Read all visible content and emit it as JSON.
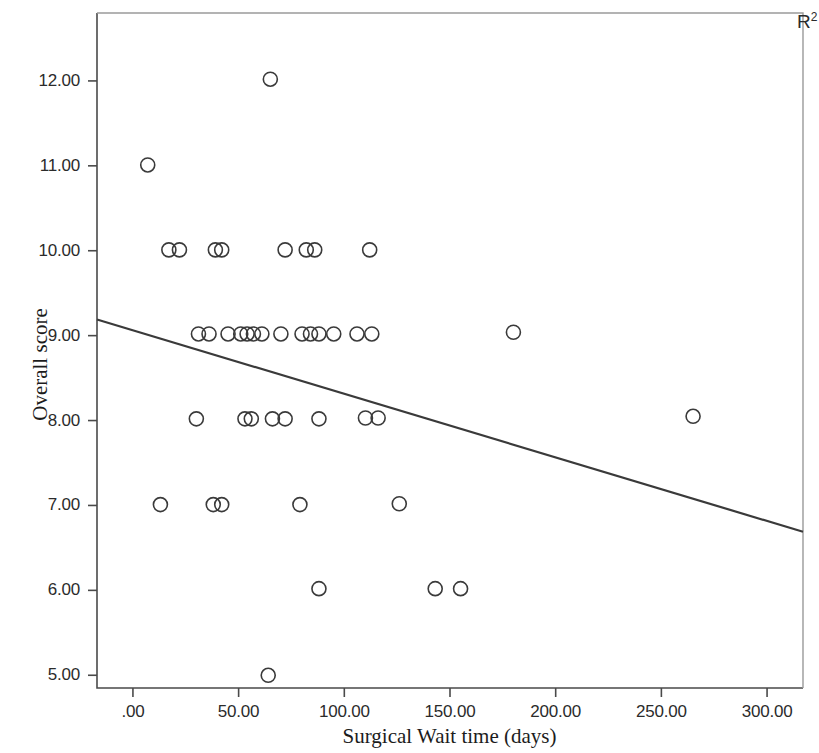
{
  "chart_data": {
    "type": "scatter",
    "title": "",
    "xlabel": "Surgical Wait time (days)",
    "ylabel": "Overall score",
    "xlim": [
      -17,
      317
    ],
    "ylim": [
      4.85,
      12.8
    ],
    "grid": false,
    "legend": null,
    "annotations": [
      {
        "name": "r-squared",
        "text": "R",
        "superscript": "2",
        "position": "top-right"
      }
    ],
    "x_ticks": [
      {
        "value": 0,
        "label": ".00"
      },
      {
        "value": 50,
        "label": "50.00"
      },
      {
        "value": 100,
        "label": "100.00"
      },
      {
        "value": 150,
        "label": "150.00"
      },
      {
        "value": 200,
        "label": "200.00"
      },
      {
        "value": 250,
        "label": "250.00"
      },
      {
        "value": 300,
        "label": "300.00"
      }
    ],
    "y_ticks": [
      {
        "value": 5,
        "label": "5.00"
      },
      {
        "value": 6,
        "label": "6.00"
      },
      {
        "value": 7,
        "label": "7.00"
      },
      {
        "value": 8,
        "label": "8.00"
      },
      {
        "value": 9,
        "label": "9.00"
      },
      {
        "value": 10,
        "label": "10.00"
      },
      {
        "value": 11,
        "label": "11.00"
      },
      {
        "value": 12,
        "label": "12.00"
      }
    ],
    "marker": {
      "shape": "circle",
      "filled": false,
      "radius": 7,
      "stroke": "#3a3a3a",
      "stroke_width": 1.6
    },
    "fit_line": {
      "name": "linear-regression-line",
      "color": "#3a3a3a",
      "width": 2.2,
      "x_start": -17,
      "y_start": 9.19,
      "x_end": 317,
      "y_end": 6.69
    },
    "points": [
      {
        "x": 65,
        "y": 12.02
      },
      {
        "x": 7,
        "y": 11.01
      },
      {
        "x": 17,
        "y": 10.01
      },
      {
        "x": 22,
        "y": 10.01
      },
      {
        "x": 39,
        "y": 10.01
      },
      {
        "x": 42,
        "y": 10.01
      },
      {
        "x": 72,
        "y": 10.01
      },
      {
        "x": 82,
        "y": 10.01
      },
      {
        "x": 86,
        "y": 10.01
      },
      {
        "x": 112,
        "y": 10.01
      },
      {
        "x": 31,
        "y": 9.02
      },
      {
        "x": 36,
        "y": 9.02
      },
      {
        "x": 45,
        "y": 9.02
      },
      {
        "x": 51,
        "y": 9.02
      },
      {
        "x": 54,
        "y": 9.02
      },
      {
        "x": 57,
        "y": 9.02
      },
      {
        "x": 61,
        "y": 9.02
      },
      {
        "x": 70,
        "y": 9.02
      },
      {
        "x": 80,
        "y": 9.02
      },
      {
        "x": 84,
        "y": 9.02
      },
      {
        "x": 88,
        "y": 9.02
      },
      {
        "x": 95,
        "y": 9.02
      },
      {
        "x": 106,
        "y": 9.02
      },
      {
        "x": 113,
        "y": 9.02
      },
      {
        "x": 180,
        "y": 9.04
      },
      {
        "x": 30,
        "y": 8.02
      },
      {
        "x": 53,
        "y": 8.02
      },
      {
        "x": 56,
        "y": 8.02
      },
      {
        "x": 66,
        "y": 8.02
      },
      {
        "x": 72,
        "y": 8.02
      },
      {
        "x": 88,
        "y": 8.02
      },
      {
        "x": 110,
        "y": 8.03
      },
      {
        "x": 116,
        "y": 8.03
      },
      {
        "x": 265,
        "y": 8.05
      },
      {
        "x": 13,
        "y": 7.01
      },
      {
        "x": 38,
        "y": 7.01
      },
      {
        "x": 42,
        "y": 7.01
      },
      {
        "x": 79,
        "y": 7.01
      },
      {
        "x": 126,
        "y": 7.02
      },
      {
        "x": 88,
        "y": 6.02
      },
      {
        "x": 143,
        "y": 6.02
      },
      {
        "x": 155,
        "y": 6.02
      },
      {
        "x": 64,
        "y": 5.0
      }
    ]
  }
}
